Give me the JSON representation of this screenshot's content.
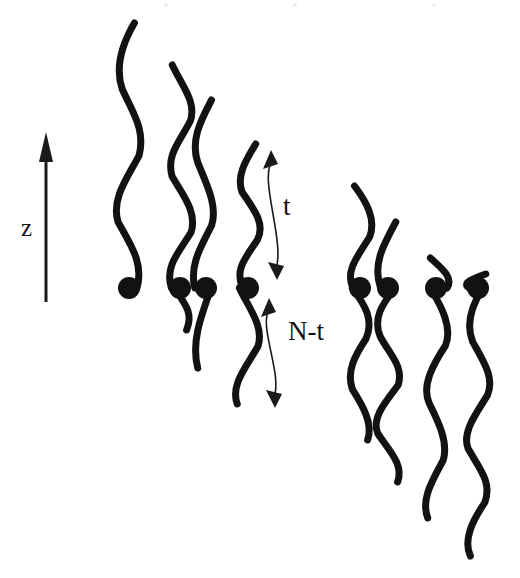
{
  "figure": {
    "name": "grafted-polymer-chain-diagram",
    "background_color": "#ffffff",
    "ink_color": "#121212",
    "width": 520,
    "height": 578
  },
  "axis": {
    "label": "z",
    "label_x": 21,
    "label_y": 236,
    "direction": "up",
    "shaft_x": 46,
    "shaft_top_y": 158,
    "shaft_bottom_y": 302,
    "head_apex_y": 132,
    "head_half_width": 7
  },
  "annotations": [
    {
      "id": "t-segment",
      "label": "t",
      "label_x": 283,
      "label_y": 215,
      "arrow_top_y": 150,
      "arrow_bottom_y": 280,
      "arrow_x": 272,
      "heads": [
        "up",
        "down"
      ]
    },
    {
      "id": "n-minus-t-segment",
      "label": "N-t",
      "label_x": 288,
      "label_y": 340,
      "arrow_top_y": 298,
      "arrow_bottom_y": 408,
      "arrow_x": 270,
      "heads": [
        "up",
        "down"
      ]
    }
  ],
  "junction_row_y": 288,
  "junction_radius": 11,
  "chain_stroke_width": 7,
  "chains": [
    {
      "id": "chain-1",
      "index": 1,
      "group": "left",
      "dot_x": 129,
      "dot_y": 288,
      "top_y": 23,
      "bottom_y": 288,
      "upper_length": 265,
      "lower_length": 0,
      "wave_amplitude": 9
    },
    {
      "id": "chain-2",
      "index": 2,
      "group": "left",
      "dot_x": 180,
      "dot_y": 288,
      "top_y": 65,
      "bottom_y": 330,
      "upper_length": 223,
      "lower_length": 42,
      "wave_amplitude": 9
    },
    {
      "id": "chain-3",
      "index": 3,
      "group": "left",
      "dot_x": 206,
      "dot_y": 288,
      "top_y": 100,
      "bottom_y": 368,
      "upper_length": 188,
      "lower_length": 80,
      "wave_amplitude": 9
    },
    {
      "id": "chain-4",
      "index": 4,
      "group": "left",
      "dot_x": 248,
      "dot_y": 288,
      "top_y": 144,
      "bottom_y": 404,
      "upper_length": 144,
      "lower_length": 116,
      "wave_amplitude": 9
    },
    {
      "id": "chain-5",
      "index": 5,
      "group": "right",
      "dot_x": 360,
      "dot_y": 288,
      "top_y": 186,
      "bottom_y": 440,
      "upper_length": 102,
      "lower_length": 152,
      "wave_amplitude": 9
    },
    {
      "id": "chain-6",
      "index": 6,
      "group": "right",
      "dot_x": 388,
      "dot_y": 288,
      "top_y": 222,
      "bottom_y": 482,
      "upper_length": 66,
      "lower_length": 194,
      "wave_amplitude": 9
    },
    {
      "id": "chain-7",
      "index": 7,
      "group": "right",
      "dot_x": 436,
      "dot_y": 288,
      "top_y": 258,
      "bottom_y": 518,
      "upper_length": 30,
      "lower_length": 230,
      "wave_amplitude": 9
    },
    {
      "id": "chain-8",
      "index": 8,
      "group": "right",
      "dot_x": 478,
      "dot_y": 288,
      "top_y": 274,
      "bottom_y": 556,
      "upper_length": 14,
      "lower_length": 268,
      "wave_amplitude": 9
    }
  ],
  "scan_specks": [
    {
      "x": 166,
      "y": 5,
      "r": 2.0
    },
    {
      "x": 295,
      "y": 5,
      "r": 2.0
    },
    {
      "x": 434,
      "y": 5,
      "r": 1.6
    },
    {
      "x": 129,
      "y": 26,
      "r": 2.2
    }
  ]
}
